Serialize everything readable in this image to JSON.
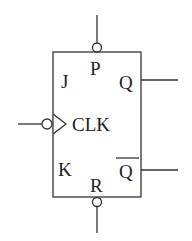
{
  "diagram": {
    "type": "JK flip-flop symbol",
    "inputs": {
      "j": "J",
      "k": "K",
      "clk": "CLK",
      "preset": "P",
      "reset": "R"
    },
    "outputs": {
      "q": "Q",
      "q_bar": "Q"
    },
    "notes": {
      "clk": "active-low edge-triggered (bubble + triangle)",
      "preset": "active-low (bubble)",
      "reset": "active-low (bubble)",
      "q_bar": "Q with overbar (complement)"
    },
    "colors": {
      "stroke": "#333333",
      "background": "#ffffff"
    }
  }
}
